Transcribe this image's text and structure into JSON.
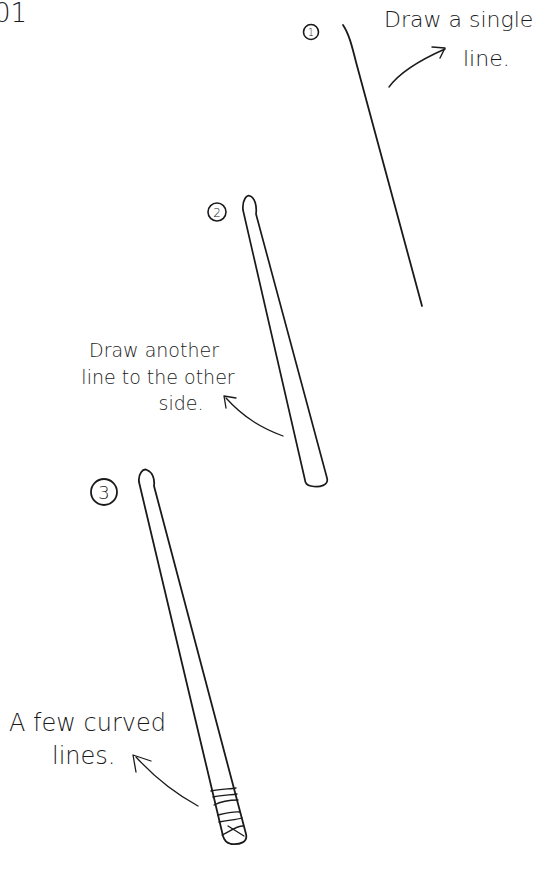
{
  "corner_fragment": "01",
  "steps": [
    {
      "number": "1",
      "caption_lines": [
        "Draw a single",
        "line."
      ]
    },
    {
      "number": "2",
      "caption_lines": [
        "Draw another",
        "line to the other",
        "side."
      ]
    },
    {
      "number": "3",
      "caption_lines": [
        "A few curved",
        "lines."
      ]
    }
  ]
}
